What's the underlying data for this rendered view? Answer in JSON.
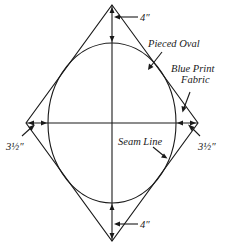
{
  "diagram": {
    "labels": {
      "top_dimension": "4″",
      "bottom_dimension": "4″",
      "left_dimension": "3½″",
      "right_dimension": "3½″",
      "pieced_oval": "Pieced Oval",
      "blue_print_line1": "Blue Print",
      "blue_print_line2": "Fabric",
      "seam_line": "Seam Line"
    },
    "shapes": {
      "diamond": {
        "top": [
          112,
          5
        ],
        "right": [
          198,
          123
        ],
        "bottom": [
          112,
          241
        ],
        "left": [
          26,
          123
        ]
      },
      "oval": {
        "cx": 112,
        "cy": 123,
        "rx": 64,
        "ry": 80
      }
    },
    "colors": {
      "stroke": "#1a1a1a",
      "background": "#ffffff"
    }
  }
}
